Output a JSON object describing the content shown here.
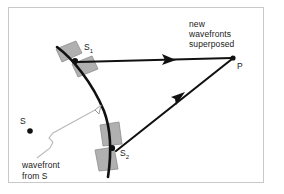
{
  "figure": {
    "background_color": "#ffffff",
    "frame_color": "#c9c9c9",
    "ink_color": "#1a1a1a",
    "wavelet_fill": "#b0b0b0",
    "wavelet_stroke": "#8a8a8a",
    "leader_color": "#b9b9b9"
  },
  "labels": {
    "superposed": "new\nwavefronts\nsuperposed",
    "point_p": "P",
    "point_s": "S",
    "source_s1_main": "S",
    "source_s1_sub": "1",
    "source_s2_main": "S",
    "source_s2_sub": "2",
    "wavefront_from_s": "wavefront\nfrom S"
  },
  "points": {
    "s": {
      "x": 30,
      "y": 131
    },
    "s1": {
      "x": 75,
      "y": 60
    },
    "s2": {
      "x": 112,
      "y": 148
    },
    "p": {
      "x": 233,
      "y": 58
    }
  },
  "icons": {
    "arrow_s1_to_p": "ray-arrow-icon",
    "arrow_s2_to_p": "ray-arrow-icon",
    "leader_arrow": "callout-arrow-icon",
    "source_dot": "point-marker-icon"
  }
}
